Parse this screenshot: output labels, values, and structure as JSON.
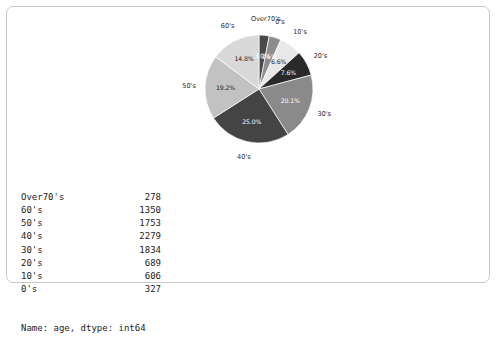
{
  "chart_data": {
    "type": "pie",
    "title": "",
    "categories": [
      "Over70's",
      "0's",
      "10's",
      "20's",
      "30's",
      "40's",
      "50's",
      "60's"
    ],
    "values": [
      278,
      327,
      606,
      689,
      1834,
      2279,
      1753,
      1350
    ],
    "percent_labels": [
      "3.0%",
      "3.6%",
      "6.6%",
      "7.6%",
      "20.1%",
      "25.0%",
      "19.2%",
      "14.8%"
    ],
    "percents": [
      3.0,
      3.6,
      6.6,
      7.6,
      20.1,
      25.0,
      19.2,
      14.8
    ],
    "colors": [
      "#4a4a4a",
      "#8c8c8c",
      "#e8e8e8",
      "#2a2a2a",
      "#8a8a8a",
      "#444444",
      "#c2c2c2",
      "#d8d8d8"
    ],
    "start_angle_deg": 90,
    "direction": "clockwise",
    "legend": "none",
    "xlabel": "",
    "ylabel": ""
  },
  "series_output": {
    "rows": [
      {
        "index": "Over70's",
        "value": "278"
      },
      {
        "index": "60's",
        "value": "1350"
      },
      {
        "index": "50's",
        "value": "1753"
      },
      {
        "index": "40's",
        "value": "2279"
      },
      {
        "index": "30's",
        "value": "1834"
      },
      {
        "index": "20's",
        "value": "689"
      },
      {
        "index": "10's",
        "value": "606"
      },
      {
        "index": "0's",
        "value": "327"
      }
    ],
    "footer": "Name: age, dtype: int64"
  }
}
